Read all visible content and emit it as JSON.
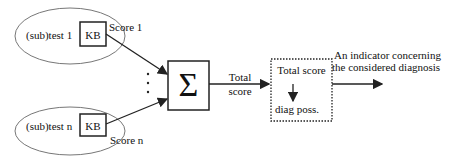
{
  "diagram": {
    "subtests": [
      {
        "label": "(sub)test 1",
        "kb_label": "KB",
        "score_label": "Score 1"
      },
      {
        "label": "(sub)test n",
        "kb_label": "KB",
        "score_label": "Score n"
      }
    ],
    "ellipsis": "⋮",
    "summation": {
      "symbol": "Σ"
    },
    "total_score_edge_label": [
      "Total",
      "score"
    ],
    "mapping_box": {
      "top_label": "Total score",
      "bottom_label": "diag poss.",
      "border_style": "dotted"
    },
    "output_label": [
      "An indicator concerning",
      "the considered diagnosis"
    ],
    "colors": {
      "stroke": "#222222",
      "ellipse_stroke": "#777777",
      "background": "#ffffff"
    }
  }
}
